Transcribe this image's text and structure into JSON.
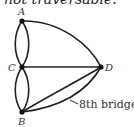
{
  "caption": "not traversable.",
  "graph": {
    "vertices": [
      {
        "id": "A",
        "label": "A"
      },
      {
        "id": "B",
        "label": "B"
      },
      {
        "id": "C",
        "label": "C"
      },
      {
        "id": "D",
        "label": "D"
      }
    ],
    "edges": [
      [
        "A",
        "C"
      ],
      [
        "A",
        "C"
      ],
      [
        "C",
        "B"
      ],
      [
        "C",
        "B"
      ],
      [
        "A",
        "D"
      ],
      [
        "C",
        "D"
      ],
      [
        "B",
        "D"
      ],
      [
        "B",
        "D"
      ]
    ],
    "annotation": "8th bridge"
  }
}
